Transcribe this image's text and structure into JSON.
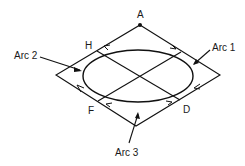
{
  "diagram": {
    "type": "geometry",
    "points": {
      "A": {
        "label": "A",
        "x": 140,
        "y": 25
      },
      "H": {
        "label": "H",
        "x": 97,
        "y": 51
      },
      "D": {
        "label": "D",
        "x": 180,
        "y": 100
      },
      "F": {
        "label": "F",
        "x": 98,
        "y": 101
      }
    },
    "arcs": [
      {
        "id": "arc1",
        "label": "Arc 1"
      },
      {
        "id": "arc2",
        "label": "Arc 2"
      },
      {
        "id": "arc3",
        "label": "Arc 3"
      }
    ],
    "colors": {
      "line": "#111111",
      "background": "#ffffff"
    }
  }
}
